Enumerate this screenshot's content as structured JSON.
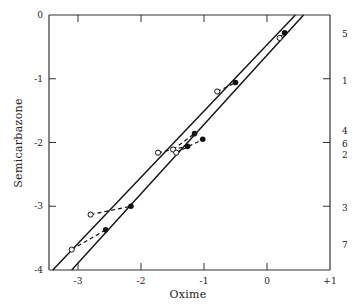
{
  "chart_data": {
    "type": "scatter",
    "title": "",
    "xlabel": "Oxime",
    "ylabel": "Semicarbazone",
    "xlim": [
      -3.45,
      1.0
    ],
    "ylim": [
      -4.0,
      0.0
    ],
    "x_ticks": [
      "-3",
      "-2",
      "-1",
      "0",
      "+1"
    ],
    "x_tick_values": [
      -3,
      -2,
      -1,
      0,
      1
    ],
    "y_ticks": [
      "0",
      "-1",
      "-2",
      "-3",
      "-4"
    ],
    "y_tick_values": [
      0,
      -1,
      -2,
      -3,
      -4
    ],
    "grid": false,
    "right_labels": [
      {
        "label": "5",
        "y": -0.3
      },
      {
        "label": "1",
        "y": -1.03
      },
      {
        "label": "4",
        "y": -1.82
      },
      {
        "label": "6",
        "y": -2.02
      },
      {
        "label": "2",
        "y": -2.2
      },
      {
        "label": "3",
        "y": -3.03
      },
      {
        "label": "7",
        "y": -3.6
      }
    ],
    "right_ticks": [
      -1,
      -2,
      -3
    ],
    "series": [
      {
        "name": "open",
        "marker": "open-circle",
        "points": [
          {
            "x": 0.2,
            "y": -0.36
          },
          {
            "x": -0.79,
            "y": -1.2
          },
          {
            "x": -1.73,
            "y": -2.16
          },
          {
            "x": -1.49,
            "y": -2.11
          },
          {
            "x": -1.44,
            "y": -2.16
          },
          {
            "x": -2.8,
            "y": -3.13
          },
          {
            "x": -3.1,
            "y": -3.68
          }
        ]
      },
      {
        "name": "filled",
        "marker": "filled-circle",
        "points": [
          {
            "x": 0.28,
            "y": -0.28
          },
          {
            "x": -0.5,
            "y": -1.06
          },
          {
            "x": -1.15,
            "y": -1.86
          },
          {
            "x": -1.02,
            "y": -1.95
          },
          {
            "x": -1.26,
            "y": -2.06
          },
          {
            "x": -2.16,
            "y": -3.0
          },
          {
            "x": -2.56,
            "y": -3.37
          }
        ]
      }
    ],
    "pairs": [
      [
        0,
        0
      ],
      [
        1,
        1
      ],
      [
        2,
        4
      ],
      [
        3,
        2
      ],
      [
        4,
        3
      ],
      [
        5,
        5
      ],
      [
        6,
        6
      ]
    ],
    "lines": [
      {
        "name": "upper-line",
        "x0": -3.4,
        "y0": -4.0,
        "x1": 0.45,
        "y1": 0.0
      },
      {
        "name": "lower-line",
        "x0": -3.1,
        "y0": -4.0,
        "x1": 0.58,
        "y1": 0.0
      }
    ]
  },
  "frame": {
    "left": 49,
    "top": 15,
    "right": 330,
    "bottom": 270
  }
}
